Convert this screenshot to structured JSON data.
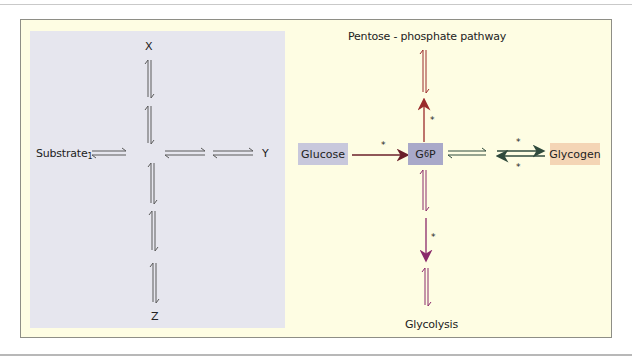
{
  "colors": {
    "frame_bg": "#fefde3",
    "left_panel_bg": "#e6e6ee",
    "equilibrium_arrow": "#5a5a5a",
    "pentose_arrow": "#9a2b2b",
    "glycolysis_arrow": "#8a2a6a",
    "glucose_arrow": "#6a1f2a",
    "glycogen_arrow": "#2f4a3c",
    "glucose_box": "#c8c8dc",
    "g6p_box": "#a9a9c9",
    "glycogen_box": "#f4d5b5"
  },
  "left_panel": {
    "substrate_label": "Substrate",
    "substrate_subscript": "1",
    "x_label": "X",
    "y_label": "Y",
    "z_label": "Z"
  },
  "right_panel": {
    "top_label": "Pentose - phosphate pathway",
    "bottom_label": "Glycolysis",
    "glucose_label": "Glucose",
    "g6p_label_main": "G",
    "g6p_subscript": "6",
    "g6p_label_suffix": "P",
    "glycogen_label": "Glycogen",
    "regulated_step_marker": "*"
  }
}
